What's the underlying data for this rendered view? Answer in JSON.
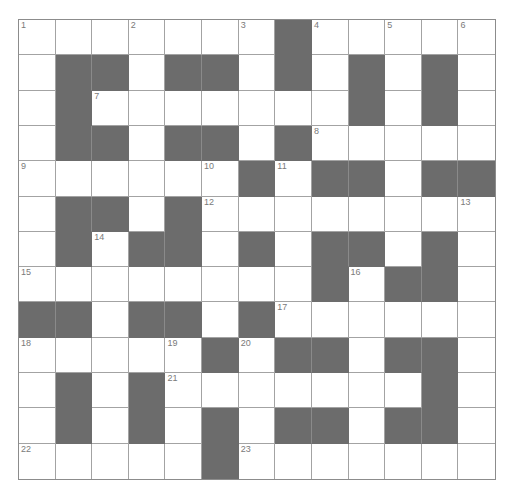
{
  "puzzle": {
    "rows": 13,
    "cols": 13,
    "colors": {
      "block": "#6c6c6c",
      "cell": "#ffffff",
      "grid_line": "#a3a3a3",
      "number": "#7a7a7a"
    },
    "layout": [
      "WWWWWWWBWWWWW",
      "WBBWBBWBWBWBW",
      "WBWWWWWWWBWBW",
      "WBBWBBWBWWWWW",
      "WWWWWWBWBBWBB",
      "WBBWBWWWWWWWW",
      "WBWBBWBWBBWBW",
      "WWWWWWWWBWBBW",
      "BBWBBWBWWWWWW",
      "WWWWWBWBBWBBW",
      "WBWBWWWWWWWBW",
      "WBWBWBWBBWBBW",
      "WWWWWBWWWWWWW"
    ],
    "numbers": [
      {
        "n": "1",
        "r": 0,
        "c": 0
      },
      {
        "n": "2",
        "r": 0,
        "c": 3
      },
      {
        "n": "3",
        "r": 0,
        "c": 6
      },
      {
        "n": "4",
        "r": 0,
        "c": 8
      },
      {
        "n": "5",
        "r": 0,
        "c": 10
      },
      {
        "n": "6",
        "r": 0,
        "c": 12
      },
      {
        "n": "7",
        "r": 2,
        "c": 2
      },
      {
        "n": "8",
        "r": 3,
        "c": 8
      },
      {
        "n": "9",
        "r": 4,
        "c": 0
      },
      {
        "n": "10",
        "r": 4,
        "c": 5
      },
      {
        "n": "11",
        "r": 4,
        "c": 7
      },
      {
        "n": "12",
        "r": 5,
        "c": 5
      },
      {
        "n": "13",
        "r": 5,
        "c": 12
      },
      {
        "n": "14",
        "r": 6,
        "c": 2
      },
      {
        "n": "15",
        "r": 7,
        "c": 0
      },
      {
        "n": "16",
        "r": 7,
        "c": 9
      },
      {
        "n": "17",
        "r": 8,
        "c": 7
      },
      {
        "n": "18",
        "r": 9,
        "c": 0
      },
      {
        "n": "19",
        "r": 9,
        "c": 4
      },
      {
        "n": "20",
        "r": 9,
        "c": 6
      },
      {
        "n": "21",
        "r": 10,
        "c": 4
      },
      {
        "n": "22",
        "r": 12,
        "c": 0
      },
      {
        "n": "23",
        "r": 12,
        "c": 6
      }
    ]
  }
}
